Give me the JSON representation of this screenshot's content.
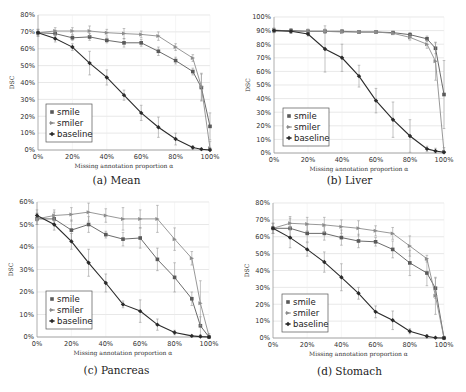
{
  "figure": {
    "colors": {
      "smile": "#5a5a5a",
      "smiler": "#8c8c8c",
      "baseline": "#2a2a2a",
      "grid": "#d8d8d8",
      "axis": "#9a9a9a",
      "errorbar": "#9a9a9a"
    },
    "legend": [
      "smile",
      "smiler",
      "baseline"
    ]
  },
  "chart_data": [
    {
      "type": "line",
      "id": "a",
      "caption": "(a) Mean",
      "title": "Mean",
      "xlabel": "Missing annotation proportion α",
      "ylabel": "DSC",
      "x": [
        0,
        10,
        20,
        30,
        40,
        50,
        60,
        70,
        80,
        90,
        95,
        100
      ],
      "xticks": [
        "0%",
        "20%",
        "40%",
        "60%",
        "80%",
        "100%"
      ],
      "yticks": [
        "0%",
        "10%",
        "20%",
        "30%",
        "40%",
        "50%",
        "60%",
        "70%",
        "80%"
      ],
      "ylim": [
        0,
        80
      ],
      "grid": true,
      "legend_position": "lower left",
      "series": [
        {
          "name": "smile",
          "values": [
            69.5,
            69,
            66.5,
            67,
            65,
            63.5,
            63.5,
            58.5,
            53,
            46.5,
            37,
            14
          ],
          "err": [
            2,
            2,
            1.5,
            2,
            1.5,
            2.5,
            2,
            2.5,
            2,
            2,
            8,
            8
          ]
        },
        {
          "name": "smiler",
          "values": [
            69.5,
            70.5,
            70.5,
            70.5,
            69.5,
            69,
            68.5,
            67.5,
            61,
            54.5,
            37.5,
            1
          ],
          "err": [
            2,
            2,
            2,
            3,
            2,
            3,
            2,
            2.5,
            2,
            2,
            8,
            4
          ]
        },
        {
          "name": "baseline",
          "values": [
            69.5,
            66,
            61,
            51.5,
            43,
            32.5,
            22,
            13.5,
            6.5,
            1.5,
            0.5,
            0
          ],
          "err": [
            2,
            2,
            2,
            7,
            4.5,
            3,
            4.5,
            6,
            3.5,
            1,
            0.5,
            0.3
          ]
        }
      ]
    },
    {
      "type": "line",
      "id": "b",
      "caption": "(b) Liver",
      "title": "Liver",
      "xlabel": "Missing annotation proportion α",
      "ylabel": "DSC",
      "x": [
        0,
        10,
        20,
        30,
        40,
        50,
        60,
        70,
        80,
        90,
        95,
        100
      ],
      "xticks": [
        "0%",
        "20%",
        "40%",
        "60%",
        "80%",
        "100%"
      ],
      "yticks": [
        "0%",
        "10%",
        "20%",
        "30%",
        "40%",
        "50%",
        "60%",
        "70%",
        "80%",
        "90%",
        "100%"
      ],
      "ylim": [
        0,
        100
      ],
      "grid": true,
      "legend_position": "lower left",
      "series": [
        {
          "name": "smile",
          "values": [
            90,
            90,
            89.5,
            89.5,
            89.5,
            89,
            89,
            88.5,
            87,
            84,
            77,
            43
          ],
          "err": [
            1.5,
            1.5,
            1.5,
            1.5,
            1,
            1,
            1,
            1,
            1.5,
            2,
            4,
            25
          ]
        },
        {
          "name": "smiler",
          "values": [
            90.5,
            89.5,
            89.5,
            89.5,
            89,
            89,
            89,
            88,
            85,
            80,
            67.5,
            1
          ],
          "err": [
            1.5,
            1.5,
            1.5,
            1.5,
            1,
            1,
            1,
            1,
            2,
            3,
            14,
            3
          ]
        },
        {
          "name": "baseline",
          "values": [
            90,
            89.5,
            87.5,
            76.5,
            70,
            56.5,
            38.5,
            24.5,
            12.5,
            3,
            1.5,
            0.5
          ],
          "err": [
            1.5,
            1.5,
            1.5,
            17,
            10,
            8,
            9,
            13,
            12,
            2,
            2,
            0.5
          ]
        }
      ]
    },
    {
      "type": "line",
      "id": "c",
      "caption": "(c) Pancreas",
      "title": "Pancreas",
      "xlabel": "Missing annotation proportion α",
      "ylabel": "DSC",
      "x": [
        0,
        10,
        20,
        30,
        40,
        50,
        60,
        70,
        80,
        90,
        95,
        100
      ],
      "xticks": [
        "0%",
        "20%",
        "40%",
        "60%",
        "80%",
        "100%"
      ],
      "yticks": [
        "0%",
        "10%",
        "20%",
        "30%",
        "40%",
        "50%",
        "60%"
      ],
      "ylim": [
        0,
        60
      ],
      "grid": true,
      "legend_position": "lower left",
      "series": [
        {
          "name": "smile",
          "values": [
            52.5,
            52.5,
            47.5,
            50,
            45.5,
            43.5,
            44,
            34.5,
            26.5,
            17,
            5,
            0
          ],
          "err": [
            2.5,
            3,
            4.5,
            3.5,
            1.5,
            3,
            4.5,
            5,
            6.5,
            3,
            4,
            0.5
          ]
        },
        {
          "name": "smiler",
          "values": [
            52.5,
            54,
            54.5,
            55.5,
            54,
            52.5,
            52.5,
            52.5,
            43.5,
            35,
            15,
            0.5
          ],
          "err": [
            2.5,
            2.5,
            3,
            4,
            3,
            5,
            4,
            6,
            5,
            3,
            10,
            1
          ]
        },
        {
          "name": "baseline",
          "values": [
            54,
            50,
            42.5,
            33,
            24,
            14.5,
            11.5,
            5.5,
            2,
            0.5,
            0.2,
            0
          ],
          "err": [
            2.5,
            2.5,
            3.5,
            6,
            4,
            1.5,
            5,
            2.5,
            1,
            0.4,
            0.3,
            0.2
          ]
        }
      ]
    },
    {
      "type": "line",
      "id": "d",
      "caption": "(d) Stomach",
      "title": "Stomach",
      "xlabel": "Missing annotation proportion α",
      "ylabel": "DSC",
      "x": [
        0,
        10,
        20,
        30,
        40,
        50,
        60,
        70,
        80,
        90,
        95,
        100
      ],
      "xticks": [
        "0%",
        "20%",
        "40%",
        "60%",
        "80%",
        "100%"
      ],
      "yticks": [
        "0%",
        "10%",
        "20%",
        "30%",
        "40%",
        "50%",
        "60%",
        "70%",
        "80%"
      ],
      "ylim": [
        0,
        80
      ],
      "grid": true,
      "legend_position": "lower left",
      "series": [
        {
          "name": "smile",
          "values": [
            65,
            65,
            62,
            62,
            59.5,
            57.5,
            57,
            52.5,
            44.5,
            38.5,
            29.5,
            0
          ],
          "err": [
            3,
            6,
            5,
            4,
            4.5,
            4,
            2.5,
            5,
            7.5,
            7.5,
            6,
            1
          ]
        },
        {
          "name": "smiler",
          "values": [
            65,
            68,
            67.5,
            67,
            66,
            65,
            63.5,
            62,
            54.5,
            47,
            25,
            0
          ],
          "err": [
            3,
            4,
            4,
            4.5,
            4,
            4.5,
            3,
            3.5,
            6,
            2,
            11,
            1
          ]
        },
        {
          "name": "baseline",
          "values": [
            65,
            59.5,
            52.5,
            45,
            36,
            26.5,
            15.5,
            10.5,
            4,
            1,
            0.2,
            0
          ],
          "err": [
            3,
            6,
            4,
            6,
            8,
            3.5,
            3.5,
            5.5,
            1.5,
            1,
            0.3,
            0.2
          ]
        }
      ]
    }
  ]
}
